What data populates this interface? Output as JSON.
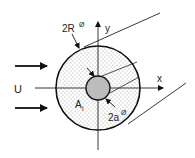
{
  "diagram": {
    "type": "cross-section of cylinder in uniform flow",
    "labels": {
      "flow_velocity": "U",
      "outer_diameter": "2R",
      "outer_diameter_symbol": "Ø",
      "inner_diameter": "2a",
      "inner_diameter_symbol": "Ø",
      "x_axis": "x",
      "y_axis": "y",
      "area_label_main": "A",
      "area_label_sub": "i"
    },
    "colors": {
      "stroke": "#111111",
      "outer_fill_dots": "#555555",
      "inner_fill": "#bdbdbd",
      "background": "#ffffff"
    },
    "flow_arrows": 2
  }
}
